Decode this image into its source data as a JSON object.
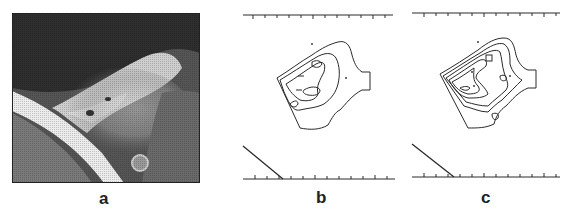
{
  "figure": {
    "panels": [
      {
        "id": "a",
        "label": "a",
        "kind": "grayscale-photograph"
      },
      {
        "id": "b",
        "label": "b",
        "kind": "contour-map"
      },
      {
        "id": "c",
        "label": "c",
        "kind": "contour-map"
      }
    ]
  },
  "colors": {
    "background": "#ffffff",
    "ink": "#2a2a2a",
    "photo_dark": "#2b2b2b",
    "photo_light": "#e8e8e8"
  }
}
